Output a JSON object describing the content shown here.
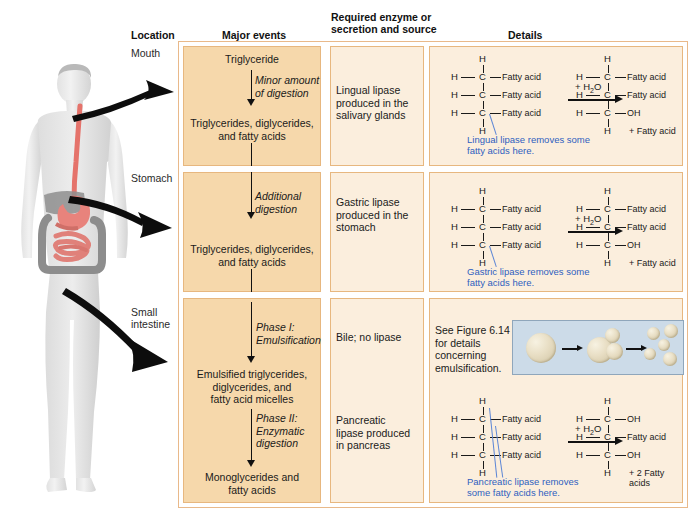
{
  "headers": {
    "location": "Location",
    "major_events": "Major events",
    "enzyme": "Required enzyme or\nsecretion and source",
    "enzyme_line1": "Required enzyme or",
    "enzyme_line2": "secretion and source",
    "details": "Details"
  },
  "locations": {
    "mouth": "Mouth",
    "stomach": "Stomach",
    "small_intestine_line1": "Small",
    "small_intestine_line2": "intestine"
  },
  "rows": [
    {
      "location": "Mouth",
      "major_events": {
        "start": "Triglyceride",
        "process_line1": "Minor amount",
        "process_line2": "of digestion",
        "end_line1": "Triglycerides, diglycerides,",
        "end_line2": "and fatty acids"
      },
      "enzyme": {
        "line1": "Lingual lipase",
        "line2": "produced in the",
        "line3": "salivary glands"
      },
      "details": {
        "reactant": {
          "top_h": "H",
          "bottom_h": "H",
          "branches": [
            "Fatty acid",
            "Fatty acid",
            "Fatty acid"
          ]
        },
        "reagent": "+ H2O",
        "product": {
          "top_h": "H",
          "bottom_h": "H",
          "branches": [
            "Fatty acid",
            "Fatty acid",
            "OH"
          ],
          "byproduct": "+ Fatty acid"
        },
        "note_line1": "Lingual lipase removes some",
        "note_line2": "fatty acids here."
      }
    },
    {
      "location": "Stomach",
      "major_events": {
        "process_line1": "Additional",
        "process_line2": "digestion",
        "end_line1": "Triglycerides, diglycerides,",
        "end_line2": "and fatty acids"
      },
      "enzyme": {
        "line1": "Gastric lipase",
        "line2": "produced in the",
        "line3": "stomach"
      },
      "details": {
        "reactant": {
          "top_h": "H",
          "bottom_h": "H",
          "branches": [
            "Fatty acid",
            "Fatty acid",
            "Fatty acid"
          ]
        },
        "reagent": "+ H2O",
        "product": {
          "top_h": "H",
          "bottom_h": "H",
          "branches": [
            "Fatty acid",
            "Fatty acid",
            "OH"
          ],
          "byproduct": "+ Fatty acid"
        },
        "note_line1": "Gastric lipase removes some",
        "note_line2": "fatty acids here."
      }
    },
    {
      "location": "Small intestine",
      "major_events": {
        "phase1_line1": "Phase I:",
        "phase1_line2": "Emulsification",
        "mid_line1": "Emulsified triglycerides,",
        "mid_line2": "diglycerides, and",
        "mid_line3": "fatty acid micelles",
        "phase2_line1": "Phase II:",
        "phase2_line2": "Enzymatic",
        "phase2_line3": "digestion",
        "end_line1": "Monoglycerides and",
        "end_line2": "fatty acids"
      },
      "enzyme_phase1": "Bile; no lipase",
      "enzyme_phase2": {
        "line1": "Pancreatic",
        "line2": "lipase produced",
        "line3": "in pancreas"
      },
      "details_phase1": {
        "note_line1": "See Figure 6.14",
        "note_line2": "for details",
        "note_line3": "concerning",
        "note_line4": "emulsification."
      },
      "details_phase2": {
        "reactant": {
          "top_h": "H",
          "bottom_h": "H",
          "branches": [
            "Fatty acid",
            "Fatty acid",
            "Fatty acid"
          ]
        },
        "reagent": "+ H2O",
        "product": {
          "top_h": "H",
          "bottom_h": "H",
          "branches": [
            "OH",
            "Fatty acid",
            "OH"
          ],
          "byproduct": "+ 2 Fatty acids"
        },
        "note_line1": "Pancreatic lipase removes",
        "note_line2": "some fatty acids here."
      }
    }
  ],
  "atoms": {
    "h": "H",
    "c": "C"
  },
  "colors": {
    "major_cell": "#f6d8ab",
    "pale_cell": "#fbeedd",
    "cell_border": "#e7b77f",
    "note_blue": "#2f5fbf",
    "emulsion_panel": "#ccdbe8",
    "arrow_black": "#111111"
  }
}
